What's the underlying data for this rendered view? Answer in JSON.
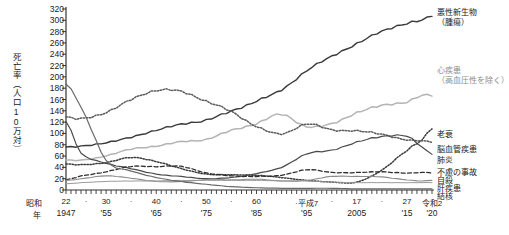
{
  "chart_data": {
    "type": "line",
    "title": "",
    "ylabel": "死亡率（人口10万対）",
    "xlabel": "年",
    "ylim": [
      0,
      320
    ],
    "ytick_step": 20,
    "yticks": [
      0,
      20,
      40,
      60,
      80,
      100,
      120,
      140,
      160,
      180,
      200,
      220,
      240,
      260,
      280,
      300,
      320
    ],
    "xlim": [
      1947,
      2020
    ],
    "grid": false,
    "legend_position": "inline-right",
    "x_axis": {
      "era_prefix": "昭和",
      "year_word": "年",
      "era_ticks": [
        {
          "label": "22",
          "year": 1947
        },
        {
          "label": "·",
          "year": 1951
        },
        {
          "label": "30",
          "year": 1955
        },
        {
          "label": "·",
          "year": 1960
        },
        {
          "label": "40",
          "year": 1965
        },
        {
          "label": "·",
          "year": 1970
        },
        {
          "label": "50",
          "year": 1975
        },
        {
          "label": "·",
          "year": 1980
        },
        {
          "label": "60",
          "year": 1985
        },
        {
          "label": "·平成7",
          "year": 1995
        },
        {
          "label": "·",
          "year": 2000
        },
        {
          "label": "17",
          "year": 2005
        },
        {
          "label": "·",
          "year": 2010
        },
        {
          "label": "27",
          "year": 2015
        },
        {
          "label": "令和2",
          "year": 2020
        }
      ],
      "western_ticks": [
        {
          "label": "1947",
          "year": 1947
        },
        {
          "label": "'55",
          "year": 1955
        },
        {
          "label": "'65",
          "year": 1965
        },
        {
          "label": "'75",
          "year": 1975
        },
        {
          "label": "'85",
          "year": 1985
        },
        {
          "label": "'95",
          "year": 1995
        },
        {
          "label": "2005",
          "year": 2005
        },
        {
          "label": "'15",
          "year": 2015
        },
        {
          "label": "'20",
          "year": 2020
        }
      ]
    },
    "x": [
      1947,
      1950,
      1955,
      1960,
      1965,
      1970,
      1975,
      1980,
      1985,
      1990,
      1995,
      2000,
      2005,
      2010,
      2015,
      2018,
      2020
    ],
    "series": [
      {
        "name": "悪性新生物（腫瘍）",
        "label_lines": [
          "悪性新生物",
          "（腫瘍）"
        ],
        "style": "solid",
        "color": "#3a3a3a",
        "width": 1.4,
        "values": [
          76,
          78,
          83,
          94,
          105,
          117,
          123,
          140,
          157,
          177,
          211,
          236,
          259,
          280,
          295,
          300,
          307
        ],
        "label_value": 307
      },
      {
        "name": "心疾患（高血圧性を除く）",
        "label_lines": [
          "心疾患",
          "（高血圧性を除く）"
        ],
        "style": "solid",
        "color": "#b4b4b4",
        "width": 1.5,
        "values": [
          53,
          53,
          60,
          73,
          77,
          86,
          89,
          106,
          117,
          134,
          112,
          117,
          137,
          149,
          156,
          167,
          166
        ],
        "label_value": 166
      },
      {
        "name": "老衰",
        "label_lines": [
          "老衰"
        ],
        "style": "dotted",
        "color": "#3a3a3a",
        "width": 1.5,
        "values": [
          46,
          45,
          48,
          58,
          50,
          38,
          28,
          27,
          26,
          22,
          17,
          14,
          14,
          35,
          70,
          88,
          108
        ],
        "label_value": 108
      },
      {
        "name": "脳血管疾患",
        "label_lines": [
          "脳血管疾患"
        ],
        "style": "dotted",
        "color": "#5a5a5a",
        "width": 1.5,
        "values": [
          129,
          127,
          136,
          161,
          175,
          175,
          156,
          139,
          112,
          99,
          117,
          106,
          105,
          98,
          89,
          87,
          84
        ],
        "label_value": 84
      },
      {
        "name": "肺炎",
        "label_lines": [
          "肺炎"
        ],
        "style": "solid",
        "color": "#4a4a4a",
        "width": 1.2,
        "values": [
          121,
          65,
          47,
          38,
          28,
          24,
          20,
          22,
          29,
          40,
          64,
          70,
          85,
          94,
          96,
          76,
          63
        ],
        "label_value": 63
      },
      {
        "name": "不慮の事故",
        "label_lines": [
          "不慮の事故"
        ],
        "style": "dashed",
        "color": "#2e2e2e",
        "width": 1.3,
        "values": [
          18,
          25,
          32,
          42,
          41,
          42,
          30,
          25,
          24,
          26,
          36,
          31,
          31,
          32,
          30,
          31,
          30
        ],
        "label_value": 30
      },
      {
        "name": "自殺",
        "label_lines": [
          "自殺"
        ],
        "style": "solid",
        "color": "#8a8a8a",
        "width": 1.1,
        "values": [
          17,
          20,
          25,
          21,
          15,
          15,
          18,
          18,
          19,
          16,
          17,
          24,
          24,
          23,
          18,
          16,
          17
        ],
        "label_value": 17
      },
      {
        "name": "肝疾患",
        "label_lines": [
          "肝疾患"
        ],
        "style": "solid",
        "color": "#9a9a9a",
        "width": 1.0,
        "values": [
          11,
          13,
          15,
          16,
          16,
          17,
          17,
          17,
          17,
          16,
          16,
          14,
          13,
          13,
          13,
          13,
          13
        ],
        "label_value": 13
      },
      {
        "name": "結核",
        "label_lines": [
          "結核"
        ],
        "style": "solid",
        "color": "#6a6a6a",
        "width": 1.2,
        "values": [
          187,
          146,
          52,
          34,
          22,
          15,
          10,
          6,
          4,
          3,
          3,
          3,
          2,
          2,
          2,
          2,
          2
        ],
        "label_value": 2
      }
    ]
  },
  "labels": {
    "cancer": "悪性新生物",
    "cancer2": "（腫瘍）",
    "heart": "心疾患",
    "heart2": "（高血圧性を除く）",
    "senility": "老衰",
    "cerebro": "脳血管疾患",
    "pneumonia": "肺炎",
    "accident": "不慮の事故",
    "suicide": "自殺",
    "liver": "肝疾患",
    "tb": "結核"
  }
}
